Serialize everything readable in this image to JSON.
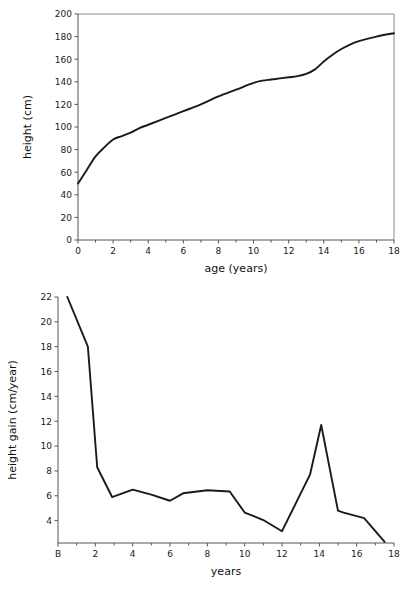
{
  "figure": {
    "background_color": "#ffffff",
    "line_color": "#1a1a1a",
    "axis_color": "#555555",
    "frame_color": "#8a8a8a",
    "caption_partial": ""
  },
  "chart_data": [
    {
      "id": "height-distance-curve",
      "type": "line",
      "title": "",
      "xlabel": "age (years)",
      "ylabel": "height (cm)",
      "xlim": [
        0,
        18
      ],
      "ylim": [
        0,
        200
      ],
      "xticks": [
        0,
        2,
        4,
        6,
        8,
        10,
        12,
        14,
        16,
        18
      ],
      "xticklabels": [
        "0",
        "2",
        "4",
        "6",
        "8",
        "10",
        "12",
        "14",
        "16",
        "18"
      ],
      "yticks": [
        0,
        20,
        40,
        60,
        80,
        100,
        120,
        140,
        160,
        180,
        200
      ],
      "yticklabels": [
        "0",
        "20",
        "40",
        "60",
        "80",
        "100",
        "120",
        "140",
        "160",
        "180",
        "200"
      ],
      "grid": false,
      "legend": false,
      "x": [
        0,
        0.5,
        1,
        1.5,
        2,
        2.5,
        3,
        3.5,
        4,
        5,
        6,
        7,
        8,
        9,
        10,
        10.5,
        11,
        11.5,
        12,
        12.5,
        13,
        13.5,
        14,
        14.5,
        15,
        15.5,
        16,
        17,
        18
      ],
      "y": [
        50,
        62,
        74,
        82,
        89,
        92,
        95,
        99,
        102,
        108,
        114,
        120,
        127,
        133,
        139,
        141,
        142,
        143,
        144,
        145,
        147,
        151,
        158,
        164,
        169,
        173,
        176,
        180,
        183
      ],
      "series": [
        {
          "name": "height",
          "values": [
            50,
            62,
            74,
            82,
            89,
            92,
            95,
            99,
            102,
            108,
            114,
            120,
            127,
            133,
            139,
            141,
            142,
            143,
            144,
            145,
            147,
            151,
            158,
            164,
            169,
            173,
            176,
            180,
            183
          ]
        }
      ]
    },
    {
      "id": "height-velocity-curve",
      "type": "line",
      "title": "",
      "xlabel": "years",
      "ylabel": "height gain (cm/year)",
      "xlim": [
        0,
        18
      ],
      "ylim": [
        2.2,
        22
      ],
      "xticks": [
        0,
        2,
        4,
        6,
        8,
        10,
        12,
        14,
        16,
        18
      ],
      "xticklabels": [
        "B",
        "2",
        "4",
        "6",
        "8",
        "10",
        "12",
        "14",
        "16",
        "18"
      ],
      "yticks": [
        4,
        6,
        8,
        10,
        12,
        14,
        16,
        18,
        20,
        22
      ],
      "yticklabels": [
        "4",
        "6",
        "8",
        "10",
        "12",
        "14",
        "16",
        "18",
        "20",
        "22"
      ],
      "grid": false,
      "legend": false,
      "x": [
        0.5,
        1.6,
        2.1,
        2.9,
        4,
        5,
        6,
        6.7,
        8,
        9.2,
        10,
        11,
        12,
        13.5,
        14.1,
        15,
        15.3,
        16.4,
        17.5
      ],
      "y": [
        22,
        18,
        8.3,
        5.9,
        6.5,
        6.1,
        5.6,
        6.2,
        6.45,
        6.35,
        4.65,
        4.05,
        3.15,
        7.7,
        11.7,
        4.8,
        4.65,
        4.2,
        2.3
      ],
      "series": [
        {
          "name": "height gain",
          "values": [
            22,
            18,
            8.3,
            5.9,
            6.5,
            6.1,
            5.6,
            6.2,
            6.45,
            6.35,
            4.65,
            4.05,
            3.15,
            7.7,
            11.7,
            4.8,
            4.65,
            4.2,
            2.3
          ]
        }
      ]
    }
  ]
}
